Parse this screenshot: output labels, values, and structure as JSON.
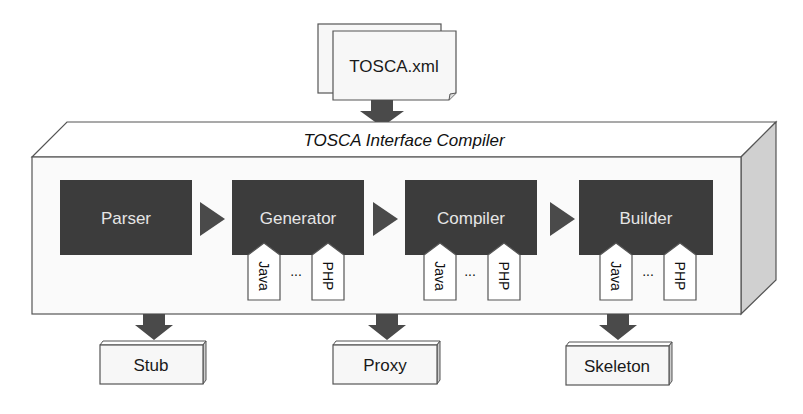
{
  "input": {
    "label": "TOSCA.xml",
    "icon": "stacked-documents-icon"
  },
  "compiler": {
    "title": "TOSCA Interface Compiler"
  },
  "stages": [
    {
      "id": "parser",
      "label": "Parser",
      "tags": []
    },
    {
      "id": "generator",
      "label": "Generator",
      "tags": [
        "Java",
        "PHP"
      ],
      "ellipsis": "..."
    },
    {
      "id": "compiler",
      "label": "Compiler",
      "tags": [
        "Java",
        "PHP"
      ],
      "ellipsis": "..."
    },
    {
      "id": "builder",
      "label": "Builder",
      "tags": [
        "Java",
        "PHP"
      ],
      "ellipsis": "..."
    }
  ],
  "outputs": [
    {
      "label": "Stub"
    },
    {
      "label": "Proxy"
    },
    {
      "label": "Skeleton"
    }
  ],
  "colors": {
    "stage_fill": "#3c3c3c",
    "arrow_fill": "#4a4a4a",
    "side_face": "#d0d0d0",
    "outline": "#555555"
  }
}
